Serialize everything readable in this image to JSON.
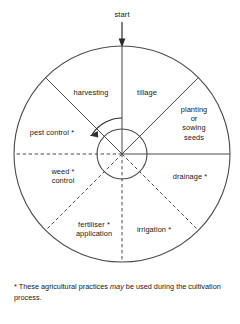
{
  "diagram": {
    "title_label": "start",
    "rotation_direction": "counterclockwise",
    "center": {
      "x": 122,
      "y": 154
    },
    "outer_radius": 108,
    "inner_radius": 25,
    "line_color": "#4a4a4a",
    "text_color": "#171717",
    "background": "#ffffff",
    "sectors": [
      {
        "id": "tillage",
        "label": "tillage",
        "starred": false,
        "boundary_style": "solid",
        "start_angle_deg": 45,
        "end_angle_deg": 90,
        "label_x": 123,
        "label_y": 88,
        "label_w": 48
      },
      {
        "id": "planting-or-sowing-seeds",
        "label": "planting\nor\nsowing\nseeds",
        "starred": false,
        "boundary_style": "solid",
        "start_angle_deg": 0,
        "end_angle_deg": 45,
        "label_x": 168,
        "label_y": 105,
        "label_w": 52
      },
      {
        "id": "drainage",
        "label": "drainage *",
        "starred": true,
        "boundary_style": "dashed",
        "start_angle_deg": -45,
        "end_angle_deg": 0,
        "label_x": 160,
        "label_y": 172,
        "label_w": 60
      },
      {
        "id": "irrigation",
        "label": "irrigation *",
        "starred": true,
        "boundary_style": "dashed",
        "start_angle_deg": -90,
        "end_angle_deg": -45,
        "label_x": 126,
        "label_y": 225,
        "label_w": 56
      },
      {
        "id": "fertiliser-application",
        "label": "fertiliser *\napplication",
        "starred": true,
        "boundary_style": "dashed",
        "start_angle_deg": -135,
        "end_angle_deg": -90,
        "label_x": 66,
        "label_y": 220,
        "label_w": 56
      },
      {
        "id": "weed-control",
        "label": "weed *\ncontrol",
        "starred": true,
        "boundary_style": "dashed",
        "start_angle_deg": 180,
        "end_angle_deg": 225,
        "label_x": 38,
        "label_y": 167,
        "label_w": 50
      },
      {
        "id": "pest-control",
        "label": "pest control *",
        "starred": true,
        "boundary_style": "solid",
        "start_angle_deg": 135,
        "end_angle_deg": 180,
        "label_x": 18,
        "label_y": 128,
        "label_w": 68
      },
      {
        "id": "harvesting",
        "label": "harvesting",
        "starred": false,
        "boundary_style": "solid",
        "start_angle_deg": 90,
        "end_angle_deg": 135,
        "label_x": 63,
        "label_y": 88,
        "label_w": 56
      }
    ],
    "footnote": {
      "marker": "*",
      "text_before_italic": " These agricultural practices ",
      "italic_word": "may",
      "text_after_italic": " be used during the cultivation process."
    }
  }
}
